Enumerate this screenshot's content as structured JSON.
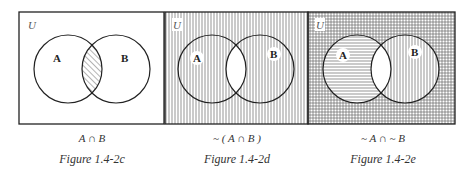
{
  "universe_label": "U",
  "set_a_label": "A",
  "set_b_label": "B",
  "panels": [
    {
      "id": "1.4-2c",
      "expression": "A ∩ B",
      "figure_label": "Figure 1.4-2c",
      "shading": {
        "outside": "none",
        "a_only": "none",
        "b_only": "none",
        "intersection": "diagonal-hatch"
      }
    },
    {
      "id": "1.4-2d",
      "expression": "~ ( A ∩ B )",
      "figure_label": "Figure 1.4-2d",
      "shading": {
        "outside": "vertical-lines",
        "a_only": "vertical-lines",
        "b_only": "vertical-lines",
        "intersection": "none"
      }
    },
    {
      "id": "1.4-2e",
      "expression": "~ A ∩ ~ B",
      "figure_label": "Figure 1.4-2e",
      "shading": {
        "outside": "grid",
        "a_only": "horizontal-lines",
        "b_only": "vertical-lines",
        "intersection": "none"
      }
    }
  ],
  "colors": {
    "line": "#222222",
    "hatch": "#555555",
    "background": "#ffffff"
  }
}
